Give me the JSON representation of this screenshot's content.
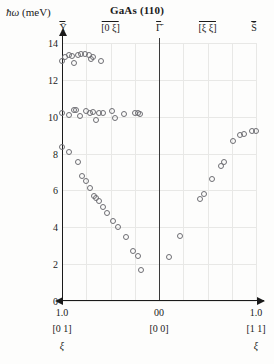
{
  "axis": {
    "y_label_symbol": "ħω",
    "y_label_unit": "(meV)"
  },
  "title": "GaAs (110)",
  "symmetry_points": [
    {
      "label": "Ȳ",
      "x_frac": 0.0
    },
    {
      "label": "[0 ξ]",
      "x_frac": 0.25
    },
    {
      "label": "Γ̄",
      "x_frac": 0.5
    },
    {
      "label": "[ξ ξ]",
      "x_frac": 0.75
    },
    {
      "label": "S̄",
      "x_frac": 1.0
    }
  ],
  "bottom_axis": {
    "numbers": [
      {
        "text": "1.0",
        "x_frac": 0.0
      },
      {
        "text": "0",
        "x_frac": 0.487
      },
      {
        "text": "0",
        "x_frac": 0.513
      },
      {
        "text": "1.0",
        "x_frac": 1.0
      }
    ],
    "brackets": [
      {
        "text": "[0 1]",
        "x_frac": 0.0
      },
      {
        "text": "[0 0]",
        "x_frac": 0.5
      },
      {
        "text": "[1 1]",
        "x_frac": 1.0
      }
    ],
    "symbols": [
      {
        "text": "ξ",
        "x_frac": 0.0
      },
      {
        "text": "ξ",
        "x_frac": 1.0
      }
    ]
  },
  "chart_data": {
    "type": "scatter",
    "title": "GaAs (110)",
    "xlabel": "",
    "ylabel": "ħω (meV)",
    "ylim": [
      0,
      14
    ],
    "yticks": [
      0,
      2,
      4,
      6,
      8,
      10,
      12,
      14
    ],
    "xlim": [
      -1.0,
      1.0
    ],
    "x_axis_note": "left half is [0 ξ] from Ȳ (ξ=1.0) to Γ̄ (ξ=0); right half is [ξ ξ] from Γ̄ (ξ=0) to S̄ (ξ=1.0)",
    "grid": true,
    "grid_vertical_count": 8,
    "grid_horizontal_count": 7,
    "legend": "none",
    "marker": "open-circle",
    "marker_color": "#6e6e73",
    "series": [
      {
        "name": "optic branch (~13 meV, [0 ξ])",
        "points": [
          {
            "x": -1.0,
            "y": 13.05
          },
          {
            "x": -0.97,
            "y": 13.25
          },
          {
            "x": -0.93,
            "y": 13.35
          },
          {
            "x": -0.9,
            "y": 13.3
          },
          {
            "x": -0.88,
            "y": 12.9
          },
          {
            "x": -0.84,
            "y": 13.35
          },
          {
            "x": -0.8,
            "y": 13.4
          },
          {
            "x": -0.76,
            "y": 13.4
          },
          {
            "x": -0.72,
            "y": 13.35
          },
          {
            "x": -0.7,
            "y": 13.15
          },
          {
            "x": -0.68,
            "y": 13.25
          },
          {
            "x": -0.6,
            "y": 13.05
          }
        ]
      },
      {
        "name": "mid branch (~10.2 meV, [0 ξ])",
        "points": [
          {
            "x": -1.0,
            "y": 10.2
          },
          {
            "x": -0.93,
            "y": 10.1
          },
          {
            "x": -0.88,
            "y": 10.35
          },
          {
            "x": -0.86,
            "y": 10.35
          },
          {
            "x": -0.81,
            "y": 10.05
          },
          {
            "x": -0.75,
            "y": 10.3
          },
          {
            "x": -0.71,
            "y": 10.2
          },
          {
            "x": -0.68,
            "y": 10.25
          },
          {
            "x": -0.65,
            "y": 9.8
          },
          {
            "x": -0.62,
            "y": 10.2
          },
          {
            "x": -0.58,
            "y": 10.2
          },
          {
            "x": -0.48,
            "y": 10.3
          },
          {
            "x": -0.45,
            "y": 9.95
          },
          {
            "x": -0.36,
            "y": 10.15
          },
          {
            "x": -0.25,
            "y": 10.2
          },
          {
            "x": -0.22,
            "y": 10.2
          },
          {
            "x": -0.2,
            "y": 10.15
          }
        ]
      },
      {
        "name": "acoustic branch ([0 ξ])",
        "points": [
          {
            "x": -1.0,
            "y": 8.35
          },
          {
            "x": -0.93,
            "y": 8.1
          },
          {
            "x": -0.84,
            "y": 7.55
          },
          {
            "x": -0.79,
            "y": 6.8
          },
          {
            "x": -0.75,
            "y": 6.5
          },
          {
            "x": -0.71,
            "y": 6.15
          },
          {
            "x": -0.67,
            "y": 5.7
          },
          {
            "x": -0.65,
            "y": 5.6
          },
          {
            "x": -0.62,
            "y": 5.45
          },
          {
            "x": -0.58,
            "y": 5.1
          },
          {
            "x": -0.54,
            "y": 4.8
          },
          {
            "x": -0.47,
            "y": 4.35
          },
          {
            "x": -0.42,
            "y": 4.0
          },
          {
            "x": -0.34,
            "y": 3.45
          },
          {
            "x": -0.27,
            "y": 2.7
          },
          {
            "x": -0.22,
            "y": 2.45
          },
          {
            "x": -0.19,
            "y": 1.7
          }
        ]
      },
      {
        "name": "acoustic branch ([ξ ξ])",
        "points": [
          {
            "x": 0.1,
            "y": 2.4
          },
          {
            "x": 0.22,
            "y": 3.55
          },
          {
            "x": 0.42,
            "y": 5.55
          },
          {
            "x": 0.46,
            "y": 5.8
          },
          {
            "x": 0.55,
            "y": 6.6
          },
          {
            "x": 0.64,
            "y": 7.35
          },
          {
            "x": 0.67,
            "y": 7.55
          },
          {
            "x": 0.76,
            "y": 8.7
          },
          {
            "x": 0.83,
            "y": 9.0
          },
          {
            "x": 0.88,
            "y": 9.05
          },
          {
            "x": 0.96,
            "y": 9.2
          },
          {
            "x": 1.0,
            "y": 9.25
          }
        ]
      }
    ]
  }
}
